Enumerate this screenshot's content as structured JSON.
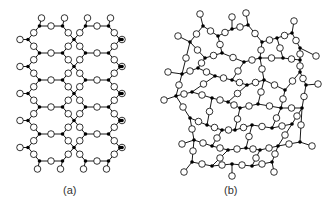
{
  "figure": {
    "panels": [
      {
        "id": "a",
        "label": "(a)",
        "description": "Crystalline SiO2 - regular hexagonal network",
        "type": "regular"
      },
      {
        "id": "b",
        "label": "(b)",
        "description": "Amorphous SiO2 - random network",
        "type": "random"
      }
    ],
    "legend": {
      "silicon_atom": "small filled black circle",
      "oxygen_atom": "open white circle with black outline"
    },
    "colors": {
      "bond": "#000000",
      "si_fill": "#000000",
      "o_fill": "#ffffff",
      "o_stroke": "#000000",
      "background": "#ffffff"
    },
    "panel_a": {
      "origin_x": 28,
      "origin_y": 26,
      "hex_w": 46,
      "hex_h": 27,
      "cols": 2,
      "rows": 5,
      "tail_right_x": 122
    },
    "panel_b": {
      "si": [
        [
          203,
          26
        ],
        [
          218,
          36
        ],
        [
          232,
          29
        ],
        [
          248,
          25
        ],
        [
          262,
          42
        ],
        [
          277,
          38
        ],
        [
          292,
          33
        ],
        [
          300,
          48
        ],
        [
          300,
          60
        ],
        [
          190,
          42
        ],
        [
          205,
          58
        ],
        [
          222,
          53
        ],
        [
          244,
          62
        ],
        [
          260,
          58
        ],
        [
          283,
          58
        ],
        [
          300,
          72
        ],
        [
          182,
          74
        ],
        [
          198,
          68
        ],
        [
          215,
          76
        ],
        [
          232,
          80
        ],
        [
          247,
          85
        ],
        [
          264,
          80
        ],
        [
          285,
          90
        ],
        [
          306,
          85
        ],
        [
          176,
          96
        ],
        [
          192,
          92
        ],
        [
          212,
          98
        ],
        [
          228,
          102
        ],
        [
          240,
          108
        ],
        [
          258,
          104
        ],
        [
          281,
          108
        ],
        [
          302,
          108
        ],
        [
          190,
          118
        ],
        [
          207,
          125
        ],
        [
          222,
          130
        ],
        [
          235,
          130
        ],
        [
          252,
          125
        ],
        [
          272,
          128
        ],
        [
          292,
          124
        ],
        [
          194,
          140
        ],
        [
          212,
          146
        ],
        [
          228,
          150
        ],
        [
          246,
          148
        ],
        [
          260,
          150
        ],
        [
          278,
          146
        ],
        [
          300,
          142
        ],
        [
          192,
          162
        ],
        [
          212,
          166
        ],
        [
          232,
          164
        ],
        [
          252,
          166
        ],
        [
          272,
          162
        ]
      ],
      "bonds": [
        [
          0,
          1
        ],
        [
          1,
          2
        ],
        [
          2,
          3
        ],
        [
          3,
          4
        ],
        [
          4,
          5
        ],
        [
          5,
          6
        ],
        [
          6,
          7
        ],
        [
          7,
          8
        ],
        [
          0,
          9
        ],
        [
          9,
          10
        ],
        [
          10,
          11
        ],
        [
          11,
          1
        ],
        [
          11,
          12
        ],
        [
          12,
          13
        ],
        [
          13,
          4
        ],
        [
          13,
          14
        ],
        [
          14,
          5
        ],
        [
          14,
          8
        ],
        [
          8,
          15
        ],
        [
          9,
          16
        ],
        [
          16,
          17
        ],
        [
          17,
          10
        ],
        [
          17,
          18
        ],
        [
          18,
          19
        ],
        [
          19,
          12
        ],
        [
          19,
          20
        ],
        [
          20,
          21
        ],
        [
          21,
          13
        ],
        [
          21,
          22
        ],
        [
          22,
          15
        ],
        [
          15,
          23
        ],
        [
          16,
          24
        ],
        [
          24,
          25
        ],
        [
          25,
          18
        ],
        [
          25,
          26
        ],
        [
          26,
          27
        ],
        [
          27,
          20
        ],
        [
          27,
          28
        ],
        [
          28,
          29
        ],
        [
          29,
          21
        ],
        [
          29,
          30
        ],
        [
          30,
          22
        ],
        [
          30,
          31
        ],
        [
          31,
          23
        ],
        [
          24,
          32
        ],
        [
          32,
          33
        ],
        [
          33,
          26
        ],
        [
          33,
          34
        ],
        [
          34,
          35
        ],
        [
          35,
          28
        ],
        [
          35,
          36
        ],
        [
          36,
          37
        ],
        [
          37,
          30
        ],
        [
          37,
          38
        ],
        [
          38,
          31
        ],
        [
          32,
          39
        ],
        [
          39,
          40
        ],
        [
          40,
          34
        ],
        [
          40,
          41
        ],
        [
          41,
          42
        ],
        [
          42,
          36
        ],
        [
          42,
          43
        ],
        [
          43,
          44
        ],
        [
          44,
          38
        ],
        [
          44,
          45
        ],
        [
          45,
          31
        ],
        [
          39,
          46
        ],
        [
          46,
          47
        ],
        [
          47,
          41
        ],
        [
          47,
          48
        ],
        [
          48,
          49
        ],
        [
          49,
          43
        ],
        [
          49,
          50
        ],
        [
          50,
          44
        ]
      ],
      "tails": [
        [
          0,
          200,
          14
        ],
        [
          3,
          246,
          13
        ],
        [
          6,
          294,
          21
        ],
        [
          2,
          232,
          17
        ],
        [
          9,
          178,
          36
        ],
        [
          16,
          168,
          72
        ],
        [
          24,
          164,
          100
        ],
        [
          23,
          318,
          84
        ],
        [
          46,
          184,
          172
        ],
        [
          48,
          232,
          176
        ],
        [
          50,
          274,
          172
        ],
        [
          45,
          312,
          146
        ],
        [
          39,
          182,
          144
        ],
        [
          7,
          316,
          56
        ]
      ]
    }
  }
}
